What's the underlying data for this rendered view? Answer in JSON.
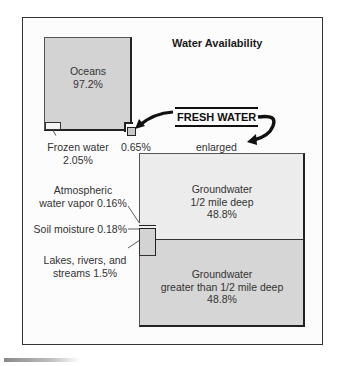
{
  "figure": {
    "title": "Water Availability",
    "oceans": {
      "name": "Oceans",
      "percent": "97.2%"
    },
    "frozen_water": {
      "name": "Frozen water",
      "percent": "2.05%"
    },
    "fresh_water": {
      "label": "FRESH WATER",
      "percent": "0.65%",
      "enlarged_label": "enlarged"
    },
    "groundwater_shallow": {
      "name": "Groundwater",
      "depth": "1/2 mile deep",
      "percent": "48.8%"
    },
    "groundwater_deep": {
      "name": "Groundwater",
      "depth": "greater than 1/2  mile deep",
      "percent": "48.8%"
    },
    "atmospheric": {
      "line1": "Atmospheric",
      "line2": "water vapor 0.16%"
    },
    "soil": {
      "label": "Soil moisture 0.18%"
    },
    "lakes": {
      "line1": "Lakes, rivers, and",
      "line2": "streams 1.5%"
    }
  },
  "colors": {
    "ocean_fill": "#d3d3d3",
    "groundwater_shallow_fill": "#ececec",
    "groundwater_deep_fill": "#d6d6d6",
    "outline": "#222222"
  }
}
